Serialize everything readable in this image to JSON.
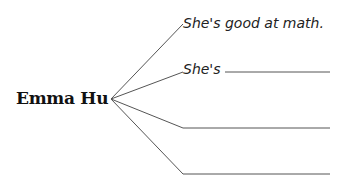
{
  "diagram": {
    "center_label": "Emma Hu",
    "branches": [
      {
        "text": "She's good at math.",
        "blank": false
      },
      {
        "text": "She's",
        "blank": true
      },
      {
        "text": "",
        "blank": true
      },
      {
        "text": "",
        "blank": true
      }
    ],
    "line_color": "#555555"
  }
}
